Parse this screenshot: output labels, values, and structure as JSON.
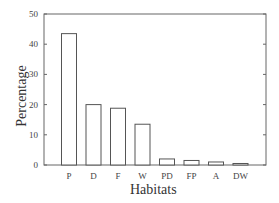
{
  "chart_data": {
    "type": "bar",
    "title": "",
    "xlabel": "Habitats",
    "ylabel": "Percentage",
    "categories": [
      "P",
      "D",
      "F",
      "W",
      "PD",
      "FP",
      "A",
      "DW"
    ],
    "values": [
      43.5,
      20,
      18.8,
      13.5,
      2,
      1.5,
      1,
      0.5
    ],
    "ylim": [
      0,
      50
    ],
    "yticks": [
      0,
      10,
      20,
      30,
      40,
      50
    ],
    "grid": false,
    "legend": null,
    "bar_fill": "#ffffff",
    "bar_edge": "#555555"
  }
}
